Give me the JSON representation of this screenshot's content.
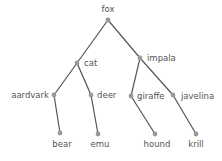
{
  "diagram": {
    "type": "tree",
    "colors": {
      "edge": "#555555",
      "node": "#999999",
      "label": "#555555"
    },
    "nodes": [
      {
        "id": "fox",
        "label": "fox",
        "x": 108,
        "y": 20,
        "lx": 108,
        "ly": 12,
        "anchor": "middle"
      },
      {
        "id": "cat",
        "label": "cat",
        "x": 77,
        "y": 63,
        "lx": 84,
        "ly": 66,
        "anchor": "start"
      },
      {
        "id": "impala",
        "label": "impala",
        "x": 140,
        "y": 58,
        "lx": 147,
        "ly": 61,
        "anchor": "start"
      },
      {
        "id": "aardvark",
        "label": "aardvark",
        "x": 54,
        "y": 95,
        "lx": 49,
        "ly": 98,
        "anchor": "end"
      },
      {
        "id": "deer",
        "label": "deer",
        "x": 91,
        "y": 95,
        "lx": 97,
        "ly": 98,
        "anchor": "start"
      },
      {
        "id": "giraffe",
        "label": "giraffe",
        "x": 131,
        "y": 96,
        "lx": 137,
        "ly": 99,
        "anchor": "start"
      },
      {
        "id": "javelina",
        "label": "javelina",
        "x": 173,
        "y": 95,
        "lx": 181,
        "ly": 99,
        "anchor": "start"
      },
      {
        "id": "bear",
        "label": "bear",
        "x": 60,
        "y": 133,
        "lx": 62,
        "ly": 147,
        "anchor": "middle"
      },
      {
        "id": "emu",
        "label": "emu",
        "x": 98,
        "y": 134,
        "lx": 100,
        "ly": 147,
        "anchor": "middle"
      },
      {
        "id": "hound",
        "label": "hound",
        "x": 155,
        "y": 134,
        "lx": 157,
        "ly": 147,
        "anchor": "middle"
      },
      {
        "id": "krill",
        "label": "krill",
        "x": 196,
        "y": 134,
        "lx": 196,
        "ly": 147,
        "anchor": "middle"
      }
    ],
    "edges": [
      [
        "fox",
        "cat"
      ],
      [
        "fox",
        "impala"
      ],
      [
        "cat",
        "aardvark"
      ],
      [
        "cat",
        "deer"
      ],
      [
        "impala",
        "giraffe"
      ],
      [
        "impala",
        "javelina"
      ],
      [
        "aardvark",
        "bear"
      ],
      [
        "deer",
        "emu"
      ],
      [
        "giraffe",
        "hound"
      ],
      [
        "javelina",
        "krill"
      ]
    ]
  }
}
